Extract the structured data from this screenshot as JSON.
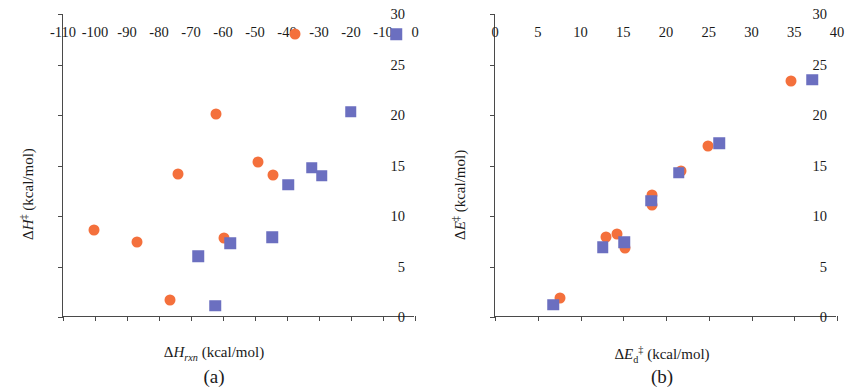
{
  "figure": {
    "panels": [
      {
        "caption": "(a)",
        "xlabel_html": "&Delta;<i>H</i><sub><i>rxn</i></sub> (kcal/mol)",
        "ylabel_html": "&Delta;<i>H</i><sup>&Dagger;</sup>  (kcal/mol)",
        "xticks": [
          -110,
          -100,
          -90,
          -80,
          -70,
          -60,
          -50,
          -40,
          -30,
          -20,
          -10,
          0
        ],
        "yticks": [
          0,
          5,
          10,
          15,
          20,
          25,
          30
        ],
        "xlim": [
          -110,
          0
        ],
        "ylim": [
          0,
          30
        ]
      },
      {
        "caption": "(b)",
        "xlabel_html": "&Delta;<i>E</i><sub>d</sub><sup>&Dagger;</sup> (kcal/mol)",
        "ylabel_html": "&Delta;<i>E</i><sup>&Dagger;</sup>  (kcal/mol)",
        "xticks": [
          0,
          5,
          10,
          15,
          20,
          25,
          30,
          35,
          40
        ],
        "yticks": [
          0,
          5,
          10,
          15,
          20,
          25,
          30
        ],
        "xlim": [
          0,
          40
        ],
        "ylim": [
          0,
          30
        ]
      }
    ]
  },
  "colors": {
    "circle_orange": "#f4703c",
    "square_blue": "#6b6fc0",
    "axis": "#4a4a4a",
    "background": "#ffffff"
  },
  "chart_data": [
    {
      "type": "scatter",
      "title": "(a)",
      "xlabel": "ΔH_rxn (kcal/mol)",
      "ylabel": "ΔH‡ (kcal/mol)",
      "xlim": [
        -110,
        0
      ],
      "ylim": [
        0,
        30
      ],
      "xticks": [
        -110,
        -100,
        -90,
        -80,
        -70,
        -60,
        -50,
        -40,
        -30,
        -20,
        -10,
        0
      ],
      "yticks": [
        0,
        5,
        10,
        15,
        20,
        25,
        30
      ],
      "grid": false,
      "legend": "none",
      "series": [
        {
          "name": "orange-circles",
          "marker": "circle",
          "color": "#f4703c",
          "points": [
            [
              -100.2,
              8.6
            ],
            [
              -87.0,
              7.4
            ],
            [
              -76.6,
              1.7
            ],
            [
              -74.2,
              14.2
            ],
            [
              -62.3,
              20.1
            ],
            [
              -59.6,
              7.8
            ],
            [
              -49.2,
              15.3
            ],
            [
              -44.4,
              14.1
            ],
            [
              -37.4,
              28.0
            ]
          ]
        },
        {
          "name": "blue-squares",
          "marker": "square",
          "color": "#6b6fc0",
          "points": [
            [
              -67.8,
              6.0
            ],
            [
              -62.5,
              1.1
            ],
            [
              -57.7,
              7.3
            ],
            [
              -44.6,
              7.9
            ],
            [
              -39.6,
              13.1
            ],
            [
              -32.2,
              14.8
            ],
            [
              -29.2,
              14.0
            ],
            [
              -20.1,
              20.3
            ],
            [
              -5.9,
              28.0
            ]
          ]
        }
      ]
    },
    {
      "type": "scatter",
      "title": "(b)",
      "xlabel": "ΔE_d‡ (kcal/mol)",
      "ylabel": "ΔE‡ (kcal/mol)",
      "xlim": [
        0,
        40
      ],
      "ylim": [
        0,
        30
      ],
      "xticks": [
        0,
        5,
        10,
        15,
        20,
        25,
        30,
        35,
        40
      ],
      "yticks": [
        0,
        5,
        10,
        15,
        20,
        25,
        30
      ],
      "grid": false,
      "legend": "none",
      "series": [
        {
          "name": "orange-circles",
          "marker": "circle",
          "color": "#f4703c",
          "points": [
            [
              7.6,
              1.9
            ],
            [
              13.0,
              7.9
            ],
            [
              14.3,
              8.2
            ],
            [
              15.2,
              6.8
            ],
            [
              18.4,
              12.1
            ],
            [
              18.4,
              11.1
            ],
            [
              21.7,
              14.5
            ],
            [
              24.9,
              16.9
            ],
            [
              34.6,
              23.4
            ]
          ]
        },
        {
          "name": "blue-squares",
          "marker": "square",
          "color": "#6b6fc0",
          "points": [
            [
              6.8,
              1.2
            ],
            [
              12.6,
              6.9
            ],
            [
              15.1,
              7.4
            ],
            [
              18.3,
              11.5
            ],
            [
              21.5,
              14.3
            ],
            [
              26.2,
              17.2
            ],
            [
              37.1,
              23.5
            ]
          ]
        }
      ]
    }
  ]
}
